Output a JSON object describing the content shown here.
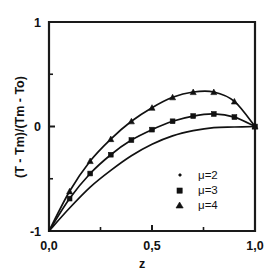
{
  "chart_data": {
    "type": "line",
    "title": "",
    "xlabel": "z",
    "ylabel": "(T - Tm)/(Tm - To)",
    "xlim": [
      0,
      1
    ],
    "ylim": [
      -1,
      1
    ],
    "grid": false,
    "legend_position": "lower-right",
    "x_ticks": [
      {
        "value": 0,
        "label": "0,0",
        "type": "major"
      },
      {
        "value": 0.25,
        "label": "",
        "type": "minor"
      },
      {
        "value": 0.5,
        "label": "0,5",
        "type": "major"
      },
      {
        "value": 0.75,
        "label": "",
        "type": "minor"
      },
      {
        "value": 1.0,
        "label": "1,0",
        "type": "major"
      }
    ],
    "y_ticks": [
      {
        "value": 1,
        "label": "1",
        "type": "major"
      },
      {
        "value": 0.5,
        "label": "",
        "type": "minor"
      },
      {
        "value": 0,
        "label": "0",
        "type": "major"
      },
      {
        "value": -0.5,
        "label": "",
        "type": "minor"
      },
      {
        "value": -1,
        "label": "-1",
        "type": "major"
      }
    ],
    "x": [
      0.0,
      0.1,
      0.2,
      0.3,
      0.4,
      0.5,
      0.6,
      0.7,
      0.8,
      0.9,
      1.0
    ],
    "series": [
      {
        "name": "μ=2",
        "mu": 2,
        "marker": "dot",
        "values": [
          -1.0,
          -0.78,
          -0.58,
          -0.42,
          -0.28,
          -0.17,
          -0.09,
          -0.04,
          -0.01,
          -0.005,
          0.0
        ]
      },
      {
        "name": "μ=3",
        "mu": 3,
        "marker": "square",
        "values": [
          -1.0,
          -0.69,
          -0.45,
          -0.27,
          -0.13,
          -0.03,
          0.05,
          0.1,
          0.12,
          0.09,
          0.0
        ]
      },
      {
        "name": "μ=4",
        "mu": 4,
        "marker": "triangle",
        "values": [
          -1.0,
          -0.62,
          -0.33,
          -0.12,
          0.05,
          0.18,
          0.28,
          0.33,
          0.33,
          0.24,
          0.0
        ]
      }
    ]
  },
  "axis": {
    "y_label": "(T - Tm)/(Tm - To)",
    "x_label": "z",
    "y_tick_top": "1",
    "y_tick_mid": "0",
    "y_tick_bottom": "-1",
    "x_tick_left": "0,0",
    "x_tick_mid": "0,5",
    "x_tick_right": "1,0"
  },
  "legend": {
    "entries": [
      {
        "label": "μ=2",
        "marker": "dot"
      },
      {
        "label": "μ=3",
        "marker": "square"
      },
      {
        "label": "μ=4",
        "marker": "triangle"
      }
    ]
  }
}
